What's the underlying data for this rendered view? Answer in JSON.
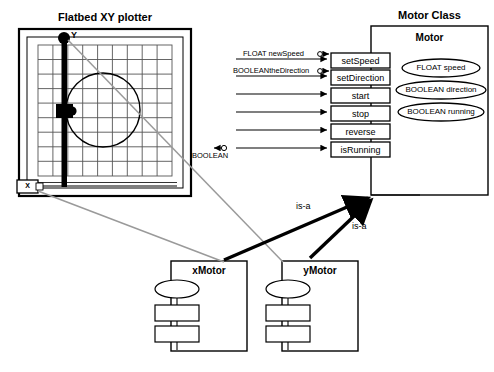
{
  "diagram": {
    "plotter": {
      "title": "Flatbed XY plotter",
      "axis_y_label": "Y",
      "axis_x_label": "X"
    },
    "motor_class": {
      "title": "Motor Class",
      "class_name": "Motor",
      "methods": [
        "setSpeed",
        "setDirection",
        "start",
        "stop",
        "reverse",
        "isRunning"
      ],
      "attributes": [
        "FLOAT speed",
        "BOOLEAN direction",
        "BOOLEAN running"
      ],
      "inputs": [
        "FLOAT newSpeed",
        "BOOLEANtheDirection"
      ],
      "outputs": [
        "BOOLEAN"
      ]
    },
    "instances": [
      {
        "name": "xMotor",
        "relation": "is-a"
      },
      {
        "name": "yMotor",
        "relation": "is-a"
      }
    ],
    "colors": {
      "stroke": "#000000",
      "link_gray": "#9a9a9a",
      "fill": "#ffffff"
    }
  }
}
